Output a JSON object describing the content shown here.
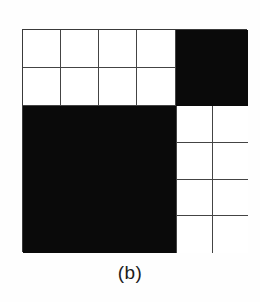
{
  "figure": {
    "caption": "(b)",
    "colors": {
      "background": "#fefefe",
      "filled": "#0a0a0a",
      "empty": "#ffffff",
      "grid_line": "#444444",
      "frame": "#3a3a3a",
      "caption_text": "#1c1c1c"
    },
    "quadrants": {
      "top_left": {
        "name": "top-left",
        "fill": "empty",
        "columns": 4,
        "rows": 2,
        "cells": [
          "empty",
          "empty",
          "empty",
          "empty",
          "empty",
          "empty",
          "empty",
          "empty"
        ]
      },
      "top_right": {
        "name": "top-right",
        "fill": "filled",
        "columns": 1,
        "rows": 1,
        "cells": [
          "filled"
        ]
      },
      "bottom_left": {
        "name": "bottom-left",
        "fill": "filled",
        "columns": 1,
        "rows": 1,
        "cells": [
          "filled"
        ]
      },
      "bottom_right": {
        "name": "bottom-right",
        "fill": "empty",
        "columns": 2,
        "rows": 4,
        "cells": [
          "empty",
          "empty",
          "empty",
          "empty",
          "empty",
          "empty",
          "empty",
          "empty"
        ]
      }
    }
  }
}
